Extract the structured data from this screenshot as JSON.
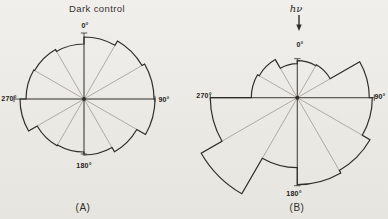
{
  "colors": {
    "paper": "#ebe9e4",
    "ink": "#2f2e2a",
    "grid": "#928f8a",
    "label": "#1d1c18"
  },
  "chart_data": [
    {
      "type": "rose",
      "title": "Dark control",
      "panel_label": "(A)",
      "angle_convention": "degrees clockwise from top (0 = up)",
      "sector_width_deg": 30,
      "sector_start_deg": [
        0,
        30,
        60,
        90,
        120,
        150,
        180,
        210,
        240,
        270,
        300,
        330
      ],
      "values": [
        62,
        67,
        70,
        71,
        61,
        56,
        53,
        54,
        64,
        58,
        57,
        55
      ],
      "units": "relative radius (px)",
      "axis_tick_labels": [
        "0°",
        "90°",
        "180°",
        "270°"
      ],
      "layout": {
        "center": {
          "x": 84,
          "y": 99
        },
        "title_pos": {
          "x": 97,
          "y": 8
        },
        "caption_pos": {
          "x": 83,
          "y": 207
        },
        "axes": [
          {
            "deg": 0,
            "len": 66,
            "label": "0°",
            "label_pos": {
              "x": 85,
              "y": 25
            }
          },
          {
            "deg": 90,
            "len": 71,
            "label": "90°",
            "label_pos": {
              "x": 164,
              "y": 99
            }
          },
          {
            "deg": 180,
            "len": 55,
            "label": "180°",
            "label_pos": {
              "x": 84,
              "y": 165
            }
          },
          {
            "deg": 270,
            "len": 70,
            "label": "270°",
            "label_pos": {
              "x": 9,
              "y": 98
            }
          }
        ]
      }
    },
    {
      "type": "rose",
      "panel_label": "(B)",
      "annotation": {
        "text": "hν",
        "text_pos": {
          "x": 296,
          "y": 8
        },
        "arrow": {
          "x": 299,
          "y1": 15,
          "y2": 31
        }
      },
      "angle_convention": "degrees clockwise from top (0 = up)",
      "sector_width_deg": 30,
      "sector_start_deg": [
        0,
        30,
        60,
        90,
        120,
        150,
        180,
        210,
        240,
        270,
        300,
        330
      ],
      "values": [
        37,
        38,
        72,
        75,
        84,
        87,
        70,
        111,
        87,
        46,
        44,
        34
      ],
      "units": "relative radius (px)",
      "axis_tick_labels": [
        "0°",
        "90°",
        "180°",
        "270°"
      ],
      "layout": {
        "center": {
          "x": 297.3,
          "y": 97.7
        },
        "caption_pos": {
          "x": 297,
          "y": 207
        },
        "axes": [
          {
            "deg": 0,
            "len": 39,
            "label": "0°",
            "label_pos": {
              "x": 300,
              "y": 44
            }
          },
          {
            "deg": 90,
            "len": 77,
            "label": "90°",
            "label_pos": {
              "x": 380,
              "y": 96
            }
          },
          {
            "deg": 180,
            "len": 88,
            "label": "180°",
            "label_pos": {
              "x": 294,
              "y": 193
            }
          },
          {
            "deg": 270,
            "len": 87,
            "label": "270°",
            "label_pos": {
              "x": 204,
              "y": 95
            }
          }
        ]
      }
    }
  ]
}
